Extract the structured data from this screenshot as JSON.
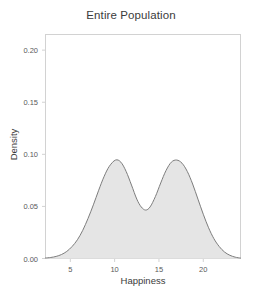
{
  "chart_data": {
    "type": "area",
    "title": "Entire Population",
    "xlabel": "Happiness",
    "ylabel": "Density",
    "xlim": [
      2.2,
      24.2
    ],
    "ylim": [
      0.0,
      0.215
    ],
    "grid": false,
    "legend": null,
    "xticks": [
      5,
      10,
      15,
      20
    ],
    "xtick_labels": [
      "5",
      "10",
      "15",
      "20"
    ],
    "yticks": [
      0.0,
      0.05,
      0.1,
      0.15,
      0.2
    ],
    "ytick_labels": [
      "0.00",
      "0.05",
      "0.10",
      "0.15",
      "0.20"
    ],
    "series": [
      {
        "name": "Entire Population",
        "kind": "kernel-density",
        "fill_color": "#e5e5e5",
        "line_color": "#7d7d7d",
        "peaks": [
          {
            "x": 10.1,
            "y": 0.0945
          },
          {
            "x": 17.0,
            "y": 0.0945
          }
        ],
        "valley": {
          "x": 13.5,
          "y": 0.0465
        },
        "x": [
          2.2,
          2.8,
          3.4,
          4.0,
          4.6,
          5.2,
          5.8,
          6.4,
          7.0,
          7.6,
          8.2,
          8.8,
          9.4,
          10.1,
          10.7,
          11.3,
          11.9,
          12.5,
          13.0,
          13.5,
          14.0,
          14.6,
          15.2,
          15.8,
          16.4,
          17.0,
          17.6,
          18.2,
          18.8,
          19.4,
          20.0,
          20.6,
          21.2,
          21.8,
          22.4,
          23.0,
          23.6,
          24.2
        ],
        "y": [
          0.0005,
          0.001,
          0.002,
          0.0038,
          0.0068,
          0.0115,
          0.018,
          0.027,
          0.0385,
          0.0515,
          0.0655,
          0.0785,
          0.0885,
          0.0945,
          0.0925,
          0.0835,
          0.0705,
          0.057,
          0.0495,
          0.0465,
          0.0495,
          0.0595,
          0.0725,
          0.0845,
          0.0925,
          0.0945,
          0.0915,
          0.0835,
          0.0715,
          0.057,
          0.0425,
          0.0295,
          0.019,
          0.0115,
          0.0062,
          0.0031,
          0.0013,
          0.0004
        ]
      }
    ]
  },
  "labels": {
    "title": "Entire Population",
    "xlabel": "Happiness",
    "ylabel": "Density"
  },
  "colors": {
    "fill": "#e5e5e5",
    "line": "#7d7d7d",
    "frame": "#d2d2d2",
    "text": "#3b3b3b",
    "tick_text": "#5a5a5a",
    "background": "#ffffff"
  }
}
